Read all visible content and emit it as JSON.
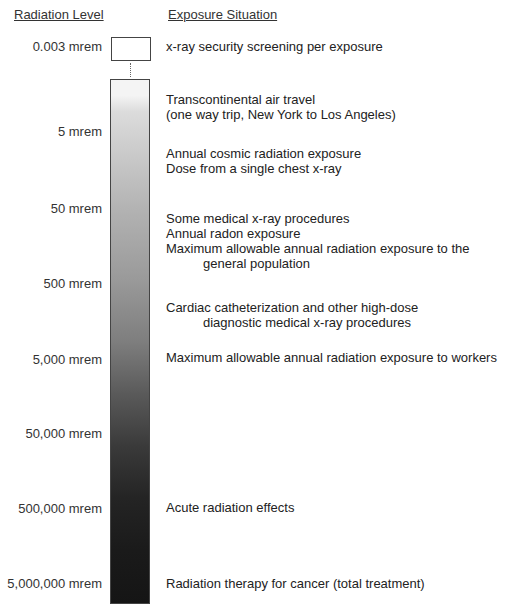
{
  "headers": {
    "left": "Radiation Level",
    "right": "Exposure Situation"
  },
  "levels": [
    {
      "label": "0.003 mrem",
      "y": 39
    },
    {
      "label": "5 mrem",
      "y": 124
    },
    {
      "label": "50 mrem",
      "y": 201
    },
    {
      "label": "500 mrem",
      "y": 276
    },
    {
      "label": "5,000 mrem",
      "y": 352
    },
    {
      "label": "50,000 mrem",
      "y": 426
    },
    {
      "label": "500,000 mrem",
      "y": 501
    },
    {
      "label": "5,000,000 mrem",
      "y": 576
    }
  ],
  "situations": [
    {
      "lines": [
        "x-ray security screening per exposure"
      ],
      "y": 39
    },
    {
      "lines": [
        "Transcontinental air travel",
        "(one way trip, New York to Los Angeles)"
      ],
      "y": 92
    },
    {
      "lines": [
        "Annual cosmic radiation exposure",
        "Dose from a single chest x-ray"
      ],
      "y": 146
    },
    {
      "lines": [
        "Some medical x-ray procedures",
        "Annual radon exposure",
        "Maximum allowable annual radiation exposure to the"
      ],
      "indented": "general population",
      "y": 211
    },
    {
      "lines": [
        "Cardiac catheterization and other high-dose"
      ],
      "indented": "diagnostic medical x-ray procedures",
      "y": 300
    },
    {
      "lines": [
        "Maximum allowable annual radiation exposure to workers"
      ],
      "y": 350
    },
    {
      "lines": [
        "Acute radiation effects"
      ],
      "y": 500
    },
    {
      "lines": [
        "Radiation therapy for cancer (total treatment)"
      ],
      "y": 576
    }
  ]
}
